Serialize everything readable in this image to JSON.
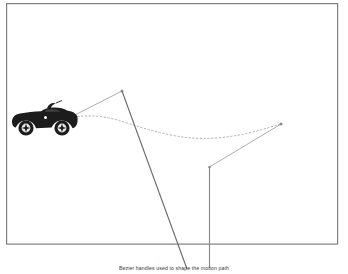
{
  "figure": {
    "caption": "Bezier handles used to shape the motion path",
    "background_color": "#ffffff",
    "frame": {
      "name": "figure-border",
      "x": 6,
      "y": 3,
      "width": 332,
      "height": 241,
      "stroke_color": "#808080",
      "stroke_width": 1.2
    },
    "car": {
      "label": "convertible-sports-car",
      "color": "#1c1c1c",
      "x": 10,
      "y": 100,
      "width": 68,
      "height": 38
    },
    "motion_path": {
      "label": "motion-path",
      "style": "dotted",
      "stroke_color": "#a8a8a8",
      "stroke_width": 0.8,
      "dash_pattern": "1.6 2.2",
      "start_point": [
        70,
        117
      ],
      "end_point": [
        281,
        124
      ],
      "control_points": [
        [
          128,
          120
        ],
        [
          188,
          141
        ],
        [
          247,
          139
        ]
      ]
    },
    "handles": [
      {
        "name": "handle-line-left",
        "from": [
          70,
          117
        ],
        "to": [
          122,
          91
        ],
        "stroke_color": "#9e9e9e",
        "stroke_width": 0.8
      },
      {
        "name": "handle-line-right",
        "from": [
          281,
          124
        ],
        "to": [
          209,
          167
        ],
        "stroke_color": "#9e9e9e",
        "stroke_width": 0.8
      }
    ],
    "leader_lines": [
      {
        "name": "leader-line-diagonal",
        "from": [
          122,
          91
        ],
        "to": [
          187,
          269
        ],
        "stroke_color": "#6e6e6e",
        "stroke_width": 1.1
      },
      {
        "name": "leader-line-vertical",
        "from": [
          209,
          167
        ],
        "to": [
          209,
          268
        ],
        "stroke_color": "#8a8a8a",
        "stroke_width": 1.1
      }
    ],
    "anchor_dots": [
      {
        "name": "anchor-dot-left",
        "x": 122,
        "y": 91,
        "r": 1.5,
        "color": "#8a8a8a"
      },
      {
        "name": "anchor-dot-right",
        "x": 281,
        "y": 124,
        "r": 1.6,
        "color": "#8a8a8a"
      },
      {
        "name": "anchor-dot-corner",
        "x": 209,
        "y": 167,
        "r": 1.4,
        "color": "#8a8a8a"
      }
    ]
  }
}
